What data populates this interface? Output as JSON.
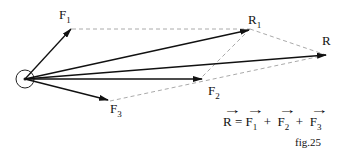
{
  "labels": {
    "F1": {
      "base": "F",
      "sub": "1"
    },
    "F2": {
      "base": "F",
      "sub": "2"
    },
    "F3": {
      "base": "F",
      "sub": "3"
    },
    "R1": {
      "base": "R",
      "sub": "1"
    },
    "R": {
      "base": "R"
    }
  },
  "equation": {
    "lhs": "R",
    "eq": "=",
    "terms": [
      {
        "base": "F",
        "sub": "1"
      },
      {
        "base": "F",
        "sub": "2"
      },
      {
        "base": "F",
        "sub": "3"
      }
    ],
    "plus": "+"
  },
  "caption": "fig.25",
  "colors": {
    "arrow": "#111111",
    "dashed": "#aaaaaa"
  }
}
